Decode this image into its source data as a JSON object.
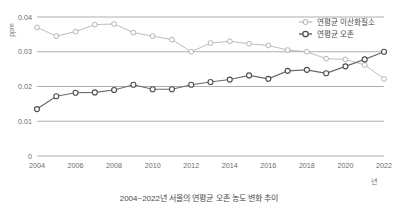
{
  "caption": "2004~2022년 서울의 연평균 오존 농도 변화 추이",
  "axis": {
    "y_unit": "ppm",
    "x_unit": "년",
    "y_ticks": [
      "0",
      "0.01",
      "0.02",
      "0.03",
      "0.04"
    ],
    "x_ticks": [
      "2004",
      "2006",
      "2008",
      "2010",
      "2012",
      "2014",
      "2016",
      "2018",
      "2020",
      "2022"
    ]
  },
  "legend": {
    "items": [
      {
        "label": "연평균 이산화질소",
        "color": "#a8a8aa",
        "marker": "open-circle"
      },
      {
        "label": "연평균 오존",
        "color": "#4f4f51",
        "marker": "open-circle-bold"
      }
    ]
  },
  "chart_data": {
    "type": "line",
    "title": "2004~2022년 서울의 연평균 오존 농도 변화 추이",
    "xlabel": "년",
    "ylabel": "ppm",
    "ylim": [
      0,
      0.04
    ],
    "xlim": [
      2004,
      2022
    ],
    "grid": true,
    "legend_position": "top-right",
    "categories": [
      2004,
      2005,
      2006,
      2007,
      2008,
      2009,
      2010,
      2011,
      2012,
      2013,
      2014,
      2015,
      2016,
      2017,
      2018,
      2019,
      2020,
      2021,
      2022
    ],
    "series": [
      {
        "name": "연평균 이산화질소",
        "color": "#a8a8aa",
        "values": [
          0.037,
          0.0345,
          0.0358,
          0.0378,
          0.038,
          0.0355,
          0.0345,
          0.0335,
          0.03,
          0.0325,
          0.033,
          0.0323,
          0.0318,
          0.0305,
          0.03,
          0.028,
          0.0278,
          0.0262,
          0.0222
        ]
      },
      {
        "name": "연평균 오존",
        "color": "#4f4f51",
        "values": [
          0.0135,
          0.0172,
          0.0182,
          0.0183,
          0.019,
          0.0205,
          0.0192,
          0.0192,
          0.0205,
          0.0213,
          0.022,
          0.0232,
          0.0222,
          0.0245,
          0.0248,
          0.0238,
          0.0258,
          0.0278,
          0.03
        ]
      }
    ]
  }
}
